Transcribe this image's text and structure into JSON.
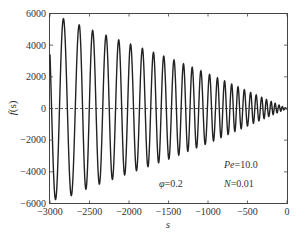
{
  "chart_data": {
    "type": "line",
    "title": "",
    "xlabel": "s",
    "ylabel": "f(s)",
    "xlim": [
      -3000,
      0
    ],
    "ylim": [
      -6000,
      6000
    ],
    "xticks": [
      -3000,
      -2500,
      -2000,
      -1500,
      -1000,
      -500,
      0
    ],
    "yticks": [
      -6000,
      -4000,
      -2000,
      0,
      2000,
      4000,
      6000
    ],
    "xtick_labels": [
      "−3000",
      "−2500",
      "−2000",
      "−1500",
      "−1000",
      "−500",
      "0"
    ],
    "ytick_labels": [
      "−6000",
      "−4000",
      "−2000",
      "0",
      "2000",
      "4000",
      "6000"
    ],
    "grid": false,
    "reference_line": {
      "y": 0,
      "style": "dashed"
    },
    "series": [
      {
        "name": "f(s)",
        "description": "Damped oscillation whose amplitude decays from ~5800 near s=-3000 to ~0 at s=0, with increasing frequency toward s=0",
        "envelope": {
          "s": [
            -3000,
            -2800,
            -2500,
            -2000,
            -1500,
            -1000,
            -500,
            0
          ],
          "amplitude": [
            5800,
            5650,
            5000,
            4100,
            3200,
            2200,
            1100,
            0
          ]
        },
        "approx_peaks": {
          "s": [
            -2830,
            -2630,
            -2460,
            -2290,
            -2130,
            -1980,
            -1830,
            -1690,
            -1560,
            -1430,
            -1310,
            -1200,
            -1090,
            -980,
            -880,
            -790,
            -700,
            -620,
            -540,
            -460,
            -390,
            -320,
            -260,
            -200,
            -150,
            -100
          ],
          "f": [
            5650,
            5150,
            4800,
            4450,
            4150,
            3850,
            3500,
            3250,
            3000,
            2750,
            2500,
            2350,
            2150,
            1950,
            1750,
            1550,
            1400,
            1250,
            1100,
            950,
            800,
            650,
            500,
            400,
            300,
            200
          ]
        }
      }
    ],
    "annotations": [
      {
        "text": "Pe = 10.0",
        "symbol": "Pe",
        "value": "10.0"
      },
      {
        "text": "φ = 0.2",
        "symbol": "φ",
        "value": "0.2"
      },
      {
        "text": "N = 0.01",
        "symbol": "N",
        "value": "0.01"
      }
    ]
  },
  "labels": {
    "xlabel": "s",
    "ylabel_f": "f",
    "ylabel_arg": "(s)",
    "pe_sym": "Pe",
    "pe_val": "=10.0",
    "phi_sym": "φ",
    "phi_val": "=0.2",
    "n_sym": "N",
    "n_val": "=0.01"
  },
  "ticks": {
    "x": [
      "−3000",
      "−2500",
      "−2000",
      "−1500",
      "−1000",
      "−500",
      "0"
    ],
    "y": [
      "6000",
      "4000",
      "2000",
      "0",
      "−2000",
      "−4000",
      "−6000"
    ]
  }
}
